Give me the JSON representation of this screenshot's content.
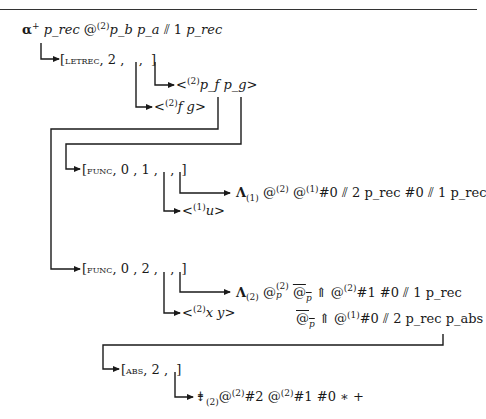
{
  "diagram": {
    "type": "term-graph",
    "root": {
      "alpha": "α",
      "alpha_sup": "+",
      "var1": "p_rec",
      "at": "@",
      "at_sup": "(2)",
      "args": "p_b p_a",
      "sep": "⫽",
      "num": "1",
      "var2": "p_rec"
    },
    "letrec": {
      "open": "[",
      "keyword": "letrec",
      "rest": ", 2 , ",
      "comma": " , ",
      "close": "]"
    },
    "letrec_body": {
      "lt": "<",
      "sup": "(2)",
      "text": "p_f p_g",
      "gt": ">"
    },
    "letrec_names": {
      "lt": "<",
      "sup": "(2)",
      "text": "f g",
      "gt": ">"
    },
    "func1": {
      "open": "[",
      "keyword": "func",
      "rest": ", 0 , 1 , ",
      "comma": " , ",
      "close": "]"
    },
    "func1_body": {
      "lambda": "Λ",
      "lambda_sub": "(1)",
      "at1": "@",
      "at1_sup": "(2)",
      "at2": "@",
      "at2_sup": "(1)",
      "text": "#0 ⫽ 2 p_rec #0 ⫽ 1 p_rec"
    },
    "func1_params": {
      "lt": "<",
      "sup": "(1)",
      "text": "u",
      "gt": ">"
    },
    "func2": {
      "open": "[",
      "keyword": "func",
      "rest": ", 0 , 2 , ",
      "comma": " , ",
      "close": "]"
    },
    "func2_body_line1": {
      "lambda": "Λ",
      "lambda_sub": "(2)",
      "at_p": "@",
      "at_p_sub": "p",
      "at_p_sup": "(2)",
      "at_bar": "@",
      "at_bar_sub": "p",
      "up": "⇑",
      "at2": "@",
      "at2_sup": "(2)",
      "text": "#1 #0 ⫽ 1 p_rec"
    },
    "func2_body_line2": {
      "at_bar": "@",
      "at_bar_sub": "p",
      "up": "⇑",
      "at": "@",
      "at_sup": "(1)",
      "text": "#0 ⫽ 2 p_rec p_abs"
    },
    "func2_params": {
      "lt": "<",
      "sup": "(2)",
      "text": "x y",
      "gt": ">"
    },
    "abs": {
      "open": "[",
      "keyword": "abs",
      "rest": ", 2 , ",
      "close": "]"
    },
    "abs_body": {
      "op": "⇟",
      "op_sub": "(2)",
      "at1": "@",
      "at1_sup": "(2)",
      "t1": "#2 ",
      "at2": "@",
      "at2_sup": "(2)",
      "t2": "#1 #0 ∗ +"
    }
  }
}
